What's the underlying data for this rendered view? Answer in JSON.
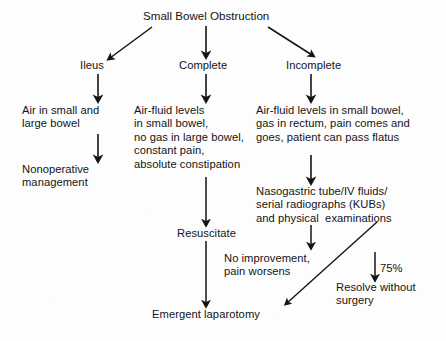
{
  "diagram": {
    "title": "Small Bowel Obstruction",
    "branches": {
      "ileus": "Ileus",
      "complete": "Complete",
      "incomplete": "Incomplete"
    },
    "nodes": {
      "ileus_findings": "Air in small and\nlarge bowel",
      "ileus_management": "Nonoperative\nmanagement",
      "complete_findings": "Air-fluid levels\nin small bowel,\nno gas in large bowel,\nconstant pain,\nabsolute constipation",
      "incomplete_findings": "Air-fluid levels in small bowel,\ngas in rectum, pain comes and\ngoes, patient can pass flatus",
      "incomplete_management": "Nasogastric tube/IV fluids/\nserial radiographs (KUBs)\nand physical  examinations",
      "resuscitate": "Resuscitate",
      "no_improvement": "No improvement,\npain worsens",
      "resolve": "Resolve without\nsurgery",
      "emergent_laparotomy": "Emergent laparotomy"
    },
    "labels": {
      "resolve_percent": "75%"
    },
    "colors": {
      "ink": "#141414",
      "background": "#fdfdfd",
      "arrow": "#141414"
    }
  }
}
